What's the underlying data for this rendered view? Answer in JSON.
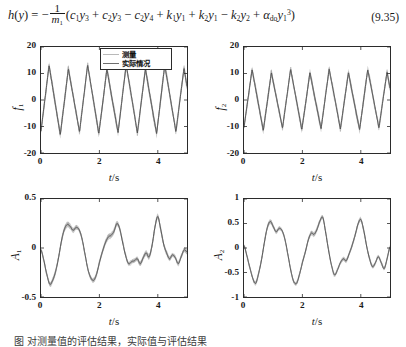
{
  "equation": {
    "number": "(9.35)",
    "lhs": "h(y)",
    "full_text": "h(y) = -(1/m1)(c1y3 + c2y3 - c2y4 + k1y1 + k2y1 - k2y2 + ado y1^3)",
    "frac_numerator": "1",
    "frac_denominator_base": "m",
    "frac_denominator_sub": "1",
    "terms": [
      {
        "op": "",
        "coef": "c",
        "coef_sub": "1",
        "var": "y",
        "var_sub": "3",
        "pow": ""
      },
      {
        "op": "+",
        "coef": "c",
        "coef_sub": "2",
        "var": "y",
        "var_sub": "3",
        "pow": ""
      },
      {
        "op": "−",
        "coef": "c",
        "coef_sub": "2",
        "var": "y",
        "var_sub": "4",
        "pow": ""
      },
      {
        "op": "+",
        "coef": "k",
        "coef_sub": "1",
        "var": "y",
        "var_sub": "1",
        "pow": ""
      },
      {
        "op": "+",
        "coef": "k",
        "coef_sub": "2",
        "var": "y",
        "var_sub": "1",
        "pow": ""
      },
      {
        "op": "−",
        "coef": "k",
        "coef_sub": "2",
        "var": "y",
        "var_sub": "2",
        "pow": ""
      },
      {
        "op": "+",
        "coef": "α",
        "coef_sub": "do",
        "var": "y",
        "var_sub": "1",
        "pow": "3"
      }
    ]
  },
  "legend": {
    "entries": [
      {
        "label": "测量",
        "color": "#b9b9b9"
      },
      {
        "label": "实际情况",
        "color": "#6e6e6e"
      }
    ]
  },
  "caption": {
    "text": "图    对测量值的评估结果，实际值与评估结果"
  },
  "chart_data": [
    {
      "id": "f1",
      "type": "line",
      "position": "top-left",
      "ylabel": "f1",
      "ylabel_base": "f",
      "ylabel_sub": "1",
      "xlabel": "t/s",
      "xlabel_var": "t",
      "xlabel_unit": "/s",
      "xlim": [
        0,
        5
      ],
      "ylim": [
        -20,
        20
      ],
      "xticks": [
        0,
        2,
        4
      ],
      "xticklabels": [
        "0",
        "2",
        "4"
      ],
      "yticks": [
        -20,
        -10,
        0,
        10,
        20
      ],
      "yticklabels": [
        "-20",
        "-10",
        "0",
        "10",
        "20"
      ],
      "grid": false,
      "has_legend": true,
      "waveform": "sawtooth",
      "period_s": 0.66,
      "amplitude": 12.5,
      "noise_band": 2.6,
      "series": [
        {
          "name": "测量",
          "color": "#b9b9b9",
          "role": "measured-band"
        },
        {
          "name": "实际情况",
          "color": "#4a4a4a",
          "role": "true-line"
        }
      ]
    },
    {
      "id": "f2",
      "type": "line",
      "position": "top-right",
      "ylabel": "f2",
      "ylabel_base": "f",
      "ylabel_sub": "2",
      "xlabel": "t/s",
      "xlabel_var": "t",
      "xlabel_unit": "/s",
      "xlim": [
        0,
        5
      ],
      "ylim": [
        -20,
        20
      ],
      "xticks": [
        0,
        2,
        4
      ],
      "xticklabels": [
        "0",
        "2",
        "4"
      ],
      "yticks": [
        -20,
        -10,
        0,
        10,
        20
      ],
      "yticklabels": [
        "-20",
        "-10",
        "0",
        "10",
        "20"
      ],
      "grid": false,
      "has_legend": false,
      "waveform": "sawtooth",
      "period_s": 0.66,
      "amplitude": 11.0,
      "noise_band": 2.4,
      "series": [
        {
          "name": "测量",
          "color": "#b9b9b9",
          "role": "measured-band"
        },
        {
          "name": "实际情况",
          "color": "#4a4a4a",
          "role": "true-line"
        }
      ]
    },
    {
      "id": "A1",
      "type": "line",
      "position": "bottom-left",
      "ylabel": "A1",
      "ylabel_base": "A",
      "ylabel_sub": "1",
      "xlabel": "t/s",
      "xlabel_var": "t",
      "xlabel_unit": "/s",
      "xlim": [
        0,
        5
      ],
      "ylim": [
        -0.5,
        0.5
      ],
      "xticks": [
        0,
        2,
        4
      ],
      "xticklabels": [
        "0",
        "2",
        "4"
      ],
      "yticks": [
        -0.5,
        0,
        0.5
      ],
      "yticklabels": [
        "-0.5",
        "0",
        "0.5"
      ],
      "grid": false,
      "has_legend": false,
      "waveform": "irregular",
      "noise_band": 0.045,
      "x": [
        0.0,
        0.1,
        0.2,
        0.3,
        0.4,
        0.5,
        0.6,
        0.7,
        0.8,
        0.9,
        1.0,
        1.1,
        1.2,
        1.3,
        1.4,
        1.5,
        1.6,
        1.7,
        1.8,
        1.9,
        2.0,
        2.1,
        2.2,
        2.3,
        2.4,
        2.5,
        2.6,
        2.7,
        2.8,
        2.9,
        3.0,
        3.1,
        3.2,
        3.3,
        3.4,
        3.5,
        3.6,
        3.7,
        3.8,
        3.9,
        4.0,
        4.1,
        4.2,
        4.3,
        4.4,
        4.5,
        4.6,
        4.7,
        4.8,
        4.9,
        5.0
      ],
      "y": [
        -0.02,
        -0.13,
        -0.27,
        -0.37,
        -0.33,
        -0.24,
        -0.1,
        0.07,
        0.19,
        0.24,
        0.22,
        0.18,
        0.21,
        0.19,
        0.1,
        -0.05,
        -0.21,
        -0.3,
        -0.33,
        -0.27,
        -0.15,
        -0.04,
        0.05,
        0.11,
        0.13,
        0.17,
        0.25,
        0.19,
        0.05,
        -0.08,
        -0.16,
        -0.14,
        -0.13,
        -0.11,
        -0.16,
        -0.1,
        -0.05,
        -0.09,
        0.02,
        0.21,
        0.32,
        0.19,
        0.04,
        -0.05,
        -0.11,
        -0.07,
        -0.1,
        -0.16,
        -0.09,
        -0.02,
        -0.04
      ],
      "series": [
        {
          "name": "测量",
          "color": "#b9b9b9",
          "role": "measured-band"
        },
        {
          "name": "实际情况",
          "color": "#4a4a4a",
          "role": "true-line"
        }
      ]
    },
    {
      "id": "A2",
      "type": "line",
      "position": "bottom-right",
      "ylabel": "A2",
      "ylabel_base": "A",
      "ylabel_sub": "2",
      "xlabel": "t/s",
      "xlabel_var": "t",
      "xlabel_unit": "/s",
      "xlim": [
        0,
        5
      ],
      "ylim": [
        -1,
        1
      ],
      "xticks": [
        0,
        2,
        4
      ],
      "xticklabels": [
        "0",
        "2",
        "4"
      ],
      "yticks": [
        -1,
        -0.5,
        0,
        0.5,
        1
      ],
      "yticklabels": [
        "-1",
        "-0.5",
        "0",
        "0.5",
        "1"
      ],
      "grid": false,
      "has_legend": false,
      "waveform": "irregular",
      "noise_band": 0.075,
      "x": [
        0.0,
        0.1,
        0.2,
        0.3,
        0.4,
        0.5,
        0.6,
        0.7,
        0.8,
        0.9,
        1.0,
        1.1,
        1.2,
        1.3,
        1.4,
        1.5,
        1.6,
        1.7,
        1.8,
        1.9,
        2.0,
        2.1,
        2.2,
        2.3,
        2.4,
        2.5,
        2.6,
        2.7,
        2.8,
        2.9,
        3.0,
        3.1,
        3.2,
        3.3,
        3.4,
        3.5,
        3.6,
        3.7,
        3.8,
        3.9,
        4.0,
        4.1,
        4.2,
        4.3,
        4.4,
        4.5,
        4.6,
        4.7,
        4.8,
        4.9,
        5.0
      ],
      "y": [
        0.05,
        -0.16,
        -0.4,
        -0.62,
        -0.72,
        -0.52,
        -0.24,
        0.12,
        0.42,
        0.54,
        0.44,
        0.33,
        0.4,
        0.36,
        0.18,
        -0.12,
        -0.45,
        -0.68,
        -0.72,
        -0.54,
        -0.3,
        -0.08,
        0.16,
        0.3,
        0.28,
        0.38,
        0.55,
        0.62,
        0.3,
        -0.06,
        -0.36,
        -0.55,
        -0.45,
        -0.3,
        -0.22,
        -0.26,
        -0.12,
        0.05,
        0.25,
        0.48,
        0.58,
        0.36,
        0.04,
        -0.22,
        -0.38,
        -0.3,
        -0.18,
        -0.3,
        -0.42,
        -0.22,
        0.02
      ],
      "series": [
        {
          "name": "测量",
          "color": "#b9b9b9",
          "role": "measured-band"
        },
        {
          "name": "实际情况",
          "color": "#4a4a4a",
          "role": "true-line"
        }
      ]
    }
  ]
}
